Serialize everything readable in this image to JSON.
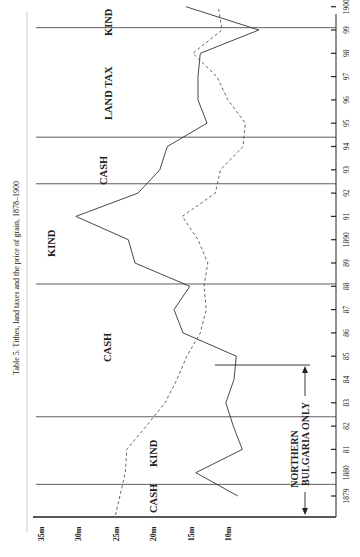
{
  "title": "Table 5. Tithes, land taxes and the price of grain, 1878–1900",
  "chart_data": {
    "type": "line",
    "orientation": "rotated-90-ccw",
    "title": "Table 5. Tithes, land taxes and the price of grain, 1878–1900",
    "xlabel": "",
    "ylabel": "",
    "x": [
      1879,
      1880,
      1881,
      1882,
      1883,
      1884,
      1885,
      1886,
      1887,
      1888,
      1889,
      1890,
      1891,
      1892,
      1893,
      1894,
      1895,
      1896,
      1897,
      1898,
      1899,
      1900
    ],
    "x_tick_labels": [
      "1879",
      "1880",
      "81",
      "82",
      "83",
      "84",
      "85",
      "86",
      "87",
      "88",
      "89",
      "1890",
      "91",
      "92",
      "93",
      "94",
      "95",
      "96",
      "97",
      "98",
      "99",
      "1900"
    ],
    "y_tick_labels": [
      "35m",
      "30m",
      "25m",
      "20m",
      "15m",
      "10m"
    ],
    "y_ticks": [
      35,
      30,
      25,
      20,
      15,
      10
    ],
    "ylim": [
      0,
      38
    ],
    "grid": false,
    "series": [
      {
        "name": "Tithes / land tax",
        "style": "solid",
        "values": [
          8.7,
          14.3,
          8.1,
          9.3,
          10.3,
          9.2,
          8.9,
          16.0,
          17.2,
          15.1,
          22.4,
          23.3,
          30.3,
          22.0,
          19.1,
          18.1,
          12.8,
          14.0,
          14.0,
          13.7,
          5.9,
          15.6
        ]
      },
      {
        "name": "Price of grain",
        "style": "dashed",
        "values": [
          25.0,
          23.7,
          23.5,
          20.9,
          18.4,
          16.8,
          15.5,
          13.7,
          12.9,
          13.2,
          12.7,
          14.0,
          16.1,
          11.7,
          11.0,
          8.0,
          7.7,
          10.0,
          11.5,
          14.7,
          10.8,
          11.3
        ]
      }
    ],
    "period_dividers_years": [
      1879.5,
      1882.4,
      1888.1,
      1892.4,
      1894.4,
      1899.1
    ],
    "annotations": [
      {
        "text": "CASH",
        "period": "1878–1879"
      },
      {
        "text": "KIND",
        "period": "1879–1882"
      },
      {
        "text": "CASH",
        "period": "1882–1888"
      },
      {
        "text": "KIND",
        "period": "1888–1892"
      },
      {
        "text": "CASH",
        "period": "1892–1894"
      },
      {
        "text": "LAND TAX",
        "period": "1894–1899"
      },
      {
        "text": "KIND",
        "period": "1899–1900"
      },
      {
        "text": "NORTHERN BULGARIA ONLY",
        "period": "1878–1885",
        "arrow": "both"
      }
    ]
  },
  "labels": {
    "cash_1": "CASH",
    "kind_1": "KIND",
    "cash_2": "CASH",
    "kind_2": "KIND",
    "cash_3": "CASH",
    "land_tax": "LAND TAX",
    "kind_3": "KIND",
    "northern": "NORTHERN",
    "bulgaria_only": "BULGARIA ONLY"
  }
}
